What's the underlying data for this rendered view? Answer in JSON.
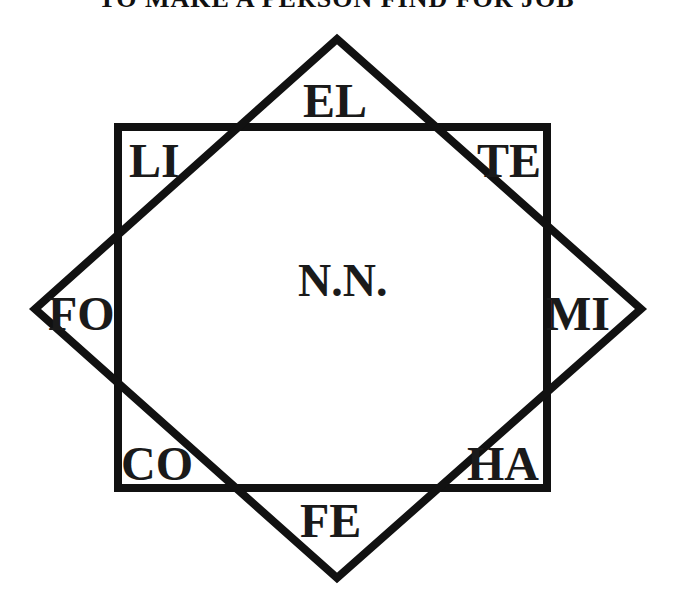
{
  "title": "TO MAKE A PERSON FIND FOR JOB",
  "diagram": {
    "center_label": "N.N.",
    "square": {
      "x": 118,
      "y": 127,
      "width": 429,
      "height": 361,
      "stroke": "#111111",
      "stroke_width": 8
    },
    "diamond": {
      "points": [
        [
          337,
          39
        ],
        [
          641,
          309
        ],
        [
          337,
          578
        ],
        [
          35,
          309
        ]
      ],
      "stroke": "#111111",
      "stroke_width": 8
    },
    "labels": {
      "top": "EL",
      "top_left": "LI",
      "top_right": "TE",
      "left": "FO",
      "right": "MI",
      "bottom_left": "CO",
      "bottom_right": "HA",
      "bottom": "FE"
    }
  }
}
